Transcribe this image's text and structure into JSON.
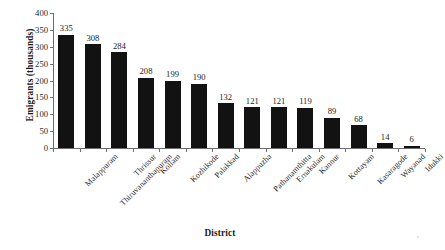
{
  "chart_data": {
    "type": "bar",
    "title": "",
    "xlabel": "District",
    "ylabel": "Emigrants (thousands)",
    "categories": [
      "Malappuram",
      "Thiruvananthapuram",
      "Thrissur",
      "Kollam",
      "Kozhikode",
      "Palakkad",
      "Alappuzha",
      "Pathanamthitta",
      "Ernakulam",
      "Kannur",
      "Kottayam",
      "Kasaragode",
      "Wayanad",
      "Idukki"
    ],
    "values": [
      335,
      308,
      284,
      208,
      199,
      190,
      132,
      121,
      121,
      119,
      89,
      68,
      14,
      6
    ],
    "value_labels": [
      "335",
      "308",
      "284",
      "208",
      "199",
      "190",
      "132",
      "121",
      "121",
      "119",
      "89",
      "68",
      "14",
      "6"
    ],
    "ylim": [
      0,
      400
    ],
    "yticks": [
      0,
      50,
      100,
      150,
      200,
      250,
      300,
      350,
      400
    ],
    "ytick_labels": [
      "0",
      "50",
      "100",
      "150",
      "200",
      "250",
      "300",
      "350",
      "400"
    ],
    "grid": false,
    "legend": false,
    "legend_position": "none",
    "bar_color": "#121212",
    "axis_color": "#6d6d6d",
    "text_color": "#232323",
    "background_color": "#ffffff",
    "label_rotation_degrees": -45
  }
}
